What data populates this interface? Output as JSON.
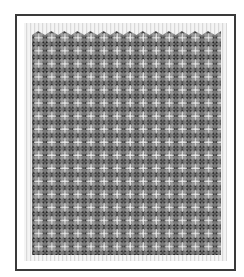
{
  "image": {
    "subject": "framed tessellated geometric pattern",
    "description": "Grayscale tiling of kite and star shapes overlaid with a grid of white cross/T marks, shown inside a dark thin frame with a light striped mat",
    "colors": {
      "frame": "#3a3a3a",
      "mat": "#e6e6e6",
      "tile_dark": "#1e1e1e",
      "tile_mid": "#6e6e6e",
      "tile_light": "#9a9a9a",
      "grid_lines": "#f2f2f2"
    },
    "grid": {
      "columns": 15,
      "rows": 17
    }
  }
}
